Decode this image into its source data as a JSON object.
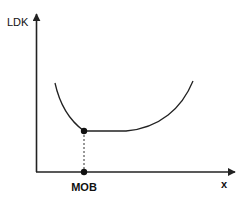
{
  "diagram": {
    "title": "",
    "y_axis": {
      "label": "LDK"
    },
    "x_axis": {
      "label": "x"
    },
    "marker": {
      "label": "MOB",
      "description": "Minimum of the curve; dashed projection onto x-axis"
    },
    "curve": {
      "description": "U-shaped curve with a flat bottom segment",
      "segments": [
        "descending",
        "flat",
        "ascending"
      ]
    },
    "colors": {
      "line": "#222222",
      "background": "#ffffff"
    }
  }
}
